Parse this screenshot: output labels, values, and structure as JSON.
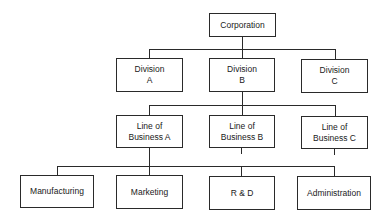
{
  "diagram": {
    "type": "org-chart",
    "root": {
      "label": "Corporation"
    },
    "divisions": [
      {
        "label": "Division\nA"
      },
      {
        "label": "Division\nB"
      },
      {
        "label": "Division\nC"
      }
    ],
    "lines_of_business": [
      {
        "label": "Line of\nBusiness A"
      },
      {
        "label": "Line of\nBusiness B"
      },
      {
        "label": "Line of\nBusiness C"
      }
    ],
    "functions": [
      {
        "label": "Manufacturing"
      },
      {
        "label": "Marketing"
      },
      {
        "label": "R & D"
      },
      {
        "label": "Administration"
      }
    ],
    "edges": [
      [
        "Corporation",
        "Division A"
      ],
      [
        "Corporation",
        "Division B"
      ],
      [
        "Corporation",
        "Division C"
      ],
      [
        "Division B",
        "Line of Business A"
      ],
      [
        "Division B",
        "Line of Business B"
      ],
      [
        "Division B",
        "Line of Business C"
      ],
      [
        "Line of Business A",
        "Manufacturing"
      ],
      [
        "Line of Business A",
        "Marketing"
      ],
      [
        "Line of Business A",
        "R & D"
      ],
      [
        "Line of Business A",
        "Administration"
      ]
    ]
  }
}
